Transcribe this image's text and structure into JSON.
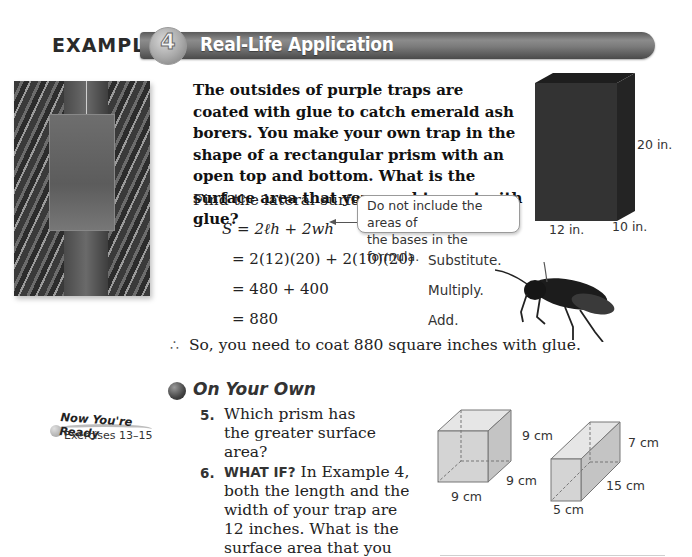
{
  "header": {
    "example_label": "EXAMPLE",
    "example_number": "4",
    "title": "Real-Life Application"
  },
  "photo": {
    "description": "purple trap hanging on ash tree",
    "icon": "photo-trap-on-tree"
  },
  "problem": {
    "statement": "The outsides of purple traps are coated with glue to catch emerald ash borers. You make your own trap in the shape of a rectangular prism with an open top and bottom. What is the surface area that you need to coat with glue?",
    "instruction": "Find the lateral surface area."
  },
  "prism_figure": {
    "height_label": "20 in.",
    "length_label": "12 in.",
    "width_label": "10 in.",
    "color": "#2e2e2e"
  },
  "callout": {
    "text_line1": "Do not include the areas of",
    "text_line2": "the bases in the formula."
  },
  "solution": {
    "steps": [
      {
        "expression": "S = 2ℓh + 2wh",
        "label": ""
      },
      {
        "expression": "= 2(12)(20) + 2(10)(20)",
        "label": "Substitute."
      },
      {
        "expression": "= 480 + 400",
        "label": "Multiply."
      },
      {
        "expression": "= 880",
        "label": "Add."
      }
    ],
    "conclusion_icon": "therefore-dots-icon",
    "conclusion": "So, you need to coat 880 square inches with glue."
  },
  "insect": {
    "description": "emerald ash borer",
    "icon": "insect-image"
  },
  "on_your_own": {
    "title": "On Your Own",
    "now_youre_ready": {
      "title": "Now You're Ready",
      "exercises": "Exercises 13–15"
    },
    "exercises": [
      {
        "number": "5.",
        "keyword": "",
        "text": "Which prism has the greater surface area?"
      },
      {
        "number": "6.",
        "keyword": "WHAT IF?",
        "text": "In Example 4, both the length and the width of your trap are 12 inches. What is the surface area that you need to coat with glue?"
      }
    ],
    "figures": {
      "cube": {
        "height": "9 cm",
        "depth": "9 cm",
        "width": "9 cm"
      },
      "prism": {
        "height": "7 cm",
        "depth": "15 cm",
        "width": "5 cm"
      }
    }
  }
}
